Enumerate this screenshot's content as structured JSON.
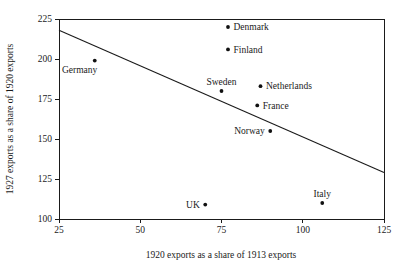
{
  "chart_data": {
    "type": "scatter",
    "title": "",
    "xlabel": "1920 exports as a share of 1913 exports",
    "ylabel": "1927 exports as a share of 1920 exports",
    "xlim": [
      25,
      125
    ],
    "ylim": [
      100,
      225
    ],
    "xticks": [
      25,
      50,
      75,
      100,
      125
    ],
    "yticks": [
      100,
      125,
      150,
      175,
      200,
      225
    ],
    "xtick_labels": [
      "25",
      "50",
      "75",
      "100",
      "125"
    ],
    "ytick_labels": [
      "100",
      "125",
      "150",
      "175",
      "200",
      "225"
    ],
    "grid": false,
    "legend": "none",
    "point_color": "#111111",
    "line_color": "#1a1a1a",
    "axis_color": "#1a1a1a",
    "background": "#ffffff",
    "points": [
      {
        "label": "Germany",
        "x": 36,
        "y": 199,
        "label_pos": "below-left"
      },
      {
        "label": "Denmark",
        "x": 77,
        "y": 220,
        "label_pos": "right"
      },
      {
        "label": "Finland",
        "x": 77,
        "y": 206,
        "label_pos": "right"
      },
      {
        "label": "Sweden",
        "x": 75,
        "y": 180,
        "label_pos": "above"
      },
      {
        "label": "Netherlands",
        "x": 87,
        "y": 183,
        "label_pos": "right"
      },
      {
        "label": "France",
        "x": 86,
        "y": 171,
        "label_pos": "right"
      },
      {
        "label": "Norway",
        "x": 90,
        "y": 155,
        "label_pos": "left"
      },
      {
        "label": "UK",
        "x": 70,
        "y": 109,
        "label_pos": "left"
      },
      {
        "label": "Italy",
        "x": 106,
        "y": 110,
        "label_pos": "above"
      }
    ],
    "trend_line": {
      "x_start": 25,
      "y_start": 218,
      "x_end": 125,
      "y_end": 129
    }
  }
}
